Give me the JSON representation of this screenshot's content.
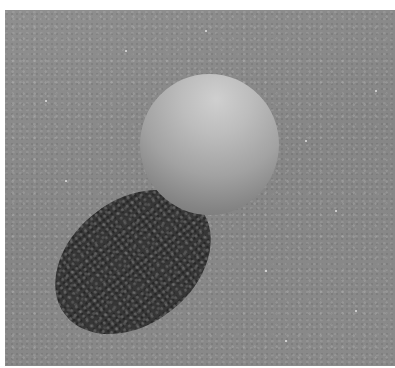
{
  "scene": {
    "description": "Grey sphere resting on a speckled grey surface, casting a dark elongated shadow toward the lower-left",
    "colors": {
      "background": "#ffffff",
      "surface": "#8c8c8c",
      "shadow": "#363636",
      "sphere_highlight": "#cfcfcf",
      "sphere_dark": "#6f6f6f"
    }
  }
}
